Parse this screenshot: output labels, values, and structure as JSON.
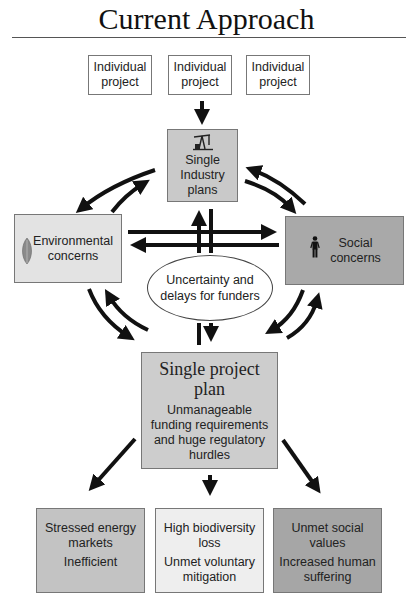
{
  "title": "Current Approach",
  "individual_projects": [
    {
      "line1": "Individual",
      "line2": "project"
    },
    {
      "line1": "Individual",
      "line2": "project"
    },
    {
      "line1": "Individual",
      "line2": "project"
    }
  ],
  "industry": {
    "icon": "oil-pump-icon",
    "line1": "Single",
    "line2": "Industry",
    "line3": "plans"
  },
  "environmental": {
    "icon": "leaf-icon",
    "line1": "Environmental",
    "line2": "concerns"
  },
  "social": {
    "icon": "person-icon",
    "line1": "Social",
    "line2": "concerns"
  },
  "uncertainty": {
    "line1": "Uncertainty and",
    "line2": "delays for funders"
  },
  "single_project": {
    "heading1": "Single project",
    "heading2": "plan",
    "sub": [
      "Unmanageable",
      "funding requirements",
      "and huge regulatory",
      "hurdles"
    ]
  },
  "outcomes": [
    {
      "a": [
        "Stressed energy",
        "markets"
      ],
      "b": [
        "Inefficient"
      ]
    },
    {
      "a": [
        "High biodiversity",
        "loss"
      ],
      "b": [
        "Unmet voluntary",
        "mitigation"
      ]
    },
    {
      "a": [
        "Unmet social",
        "values"
      ],
      "b": [
        "Increased human",
        "suffering"
      ]
    }
  ],
  "colors": {
    "industry_fill": "#c9c9c9",
    "environmental_fill": "#e3e3e3",
    "social_fill": "#a9a9a9",
    "project_plan_fill": "#cdcdcd",
    "outcome_energy_fill": "#c3c3c3",
    "outcome_biodiversity_fill": "#eeeeee",
    "outcome_social_fill": "#a6a6a6",
    "arrow": "#111111"
  }
}
